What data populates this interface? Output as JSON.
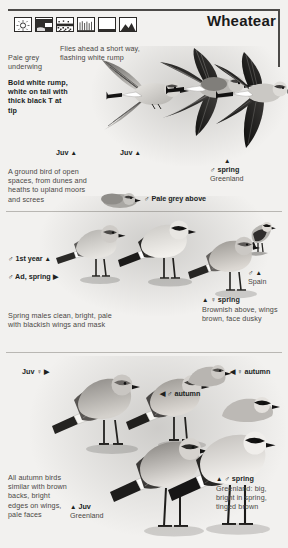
{
  "header": {
    "title": "Wheatear",
    "habitat_icons": [
      {
        "name": "sun-dunes-icon",
        "label": "open sunny ground"
      },
      {
        "name": "cliff-icon",
        "label": "cliffs / rocky slope"
      },
      {
        "name": "stony-ground-icon",
        "label": "stony ground / scree"
      },
      {
        "name": "grass-icon",
        "label": "short grass / heath"
      },
      {
        "name": "plain-icon",
        "label": "open plain"
      },
      {
        "name": "upland-moor-icon",
        "label": "upland moor"
      }
    ]
  },
  "panel_top": {
    "caption_underwing": "Pale grey underwing",
    "caption_rump": "Bold white rump, white on tail with thick black T at tip",
    "caption_flight": "Flies ahead a short way, flashing white rump",
    "label_juv_left": "Juv",
    "label_juv_mid": "Juv",
    "label_male_spring": "♂ spring",
    "label_male_spring_loc": "Greenland",
    "caption_habitat": "A ground bird of open spaces, from dunes and heaths to upland moors and screes"
  },
  "panel_mid": {
    "label_pale_grey_above": "♂ Pale grey above",
    "label_first_year": "♂ 1st year",
    "label_ad_spring": "♂ Ad, spring",
    "label_spain": "♂",
    "label_spain_loc": "Spain",
    "label_female_spring": "♀ spring",
    "caption_female_spring": "Brownish above, wings brown, face dusky",
    "caption_spring_males": "Spring males clean, bright, pale with blackish wings and mask"
  },
  "panel_bottom": {
    "label_juv_female": "Juv ♀",
    "label_male_autumn": "♂ autumn",
    "label_female_autumn": "♀ autumn",
    "caption_autumn": "All autumn birds similar with brown backs, bright edges on wings, pale faces",
    "label_juv_greenland": "Juv",
    "label_juv_greenland_loc": "Greenland",
    "label_male_spring_greenland": "♂ spring",
    "caption_male_spring_greenland": "Greenland: big, bright in spring, tinged brown"
  },
  "glyphs": {
    "tri_up": "▲",
    "tri_right": "▶",
    "tri_left": "◀",
    "male": "♂",
    "female": "♀"
  },
  "colors": {
    "page_bg": "#f2f1ef",
    "rule": "#4c4a48",
    "text": "#4a4845",
    "text_bold": "#201f1e"
  }
}
